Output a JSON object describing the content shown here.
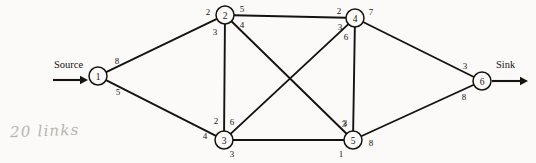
{
  "diagram": {
    "node_radius": 9,
    "ink_color": "#16130f",
    "background_color": "#fbfaf9",
    "pencil_color": "#b9b4ad",
    "terminals": {
      "source_label": "Source",
      "sink_label": "Sink"
    },
    "annotation": {
      "text": "20 links"
    },
    "nodes": [
      {
        "id": "1",
        "label": "1",
        "x": 98,
        "y": 76
      },
      {
        "id": "2",
        "label": "2",
        "x": 225,
        "y": 15
      },
      {
        "id": "3",
        "label": "3",
        "x": 224,
        "y": 140
      },
      {
        "id": "4",
        "label": "4",
        "x": 355,
        "y": 18
      },
      {
        "id": "5",
        "label": "5",
        "x": 353,
        "y": 140
      },
      {
        "id": "6",
        "label": "6",
        "x": 482,
        "y": 81
      }
    ],
    "edges": [
      {
        "id": "e-1-2",
        "from": "1",
        "to": "2",
        "cap_from": "8",
        "cap_to": "2",
        "from_label_x": 117,
        "from_label_y": 61,
        "to_label_x": 208,
        "to_label_y": 12
      },
      {
        "id": "e-1-3",
        "from": "1",
        "to": "3",
        "cap_from": "5",
        "cap_to": "4",
        "from_label_x": 118,
        "from_label_y": 92,
        "to_label_x": 205,
        "to_label_y": 136
      },
      {
        "id": "e-2-3",
        "from": "2",
        "to": "3",
        "cap_from": "3",
        "cap_to": "2",
        "from_label_x": 215,
        "from_label_y": 32,
        "to_label_x": 216,
        "to_label_y": 121
      },
      {
        "id": "e-2-4",
        "from": "2",
        "to": "4",
        "cap_from": "5",
        "cap_to": "2",
        "from_label_x": 242,
        "from_label_y": 9,
        "to_label_x": 339,
        "to_label_y": 11
      },
      {
        "id": "e-2-5",
        "from": "2",
        "to": "5",
        "cap_from": "4",
        "cap_to": "3",
        "from_label_x": 242,
        "from_label_y": 25,
        "to_label_x": 345,
        "to_label_y": 123
      },
      {
        "id": "e-3-4",
        "from": "3",
        "to": "4",
        "cap_from": "6",
        "cap_to": "3",
        "from_label_x": 232,
        "from_label_y": 122,
        "to_label_x": 340,
        "to_label_y": 27
      },
      {
        "id": "e-3-5",
        "from": "3",
        "to": "5",
        "cap_from": "3",
        "cap_to": "1",
        "from_label_x": 232,
        "from_label_y": 154,
        "to_label_x": 341,
        "to_label_y": 154
      },
      {
        "id": "e-4-5",
        "from": "4",
        "to": "5",
        "cap_from": "6",
        "cap_to": "3",
        "from_label_x": 346,
        "from_label_y": 37,
        "to_label_x": 344,
        "to_label_y": 124
      },
      {
        "id": "e-4-6",
        "from": "4",
        "to": "6",
        "cap_from": "7",
        "cap_to": "3",
        "from_label_x": 371,
        "from_label_y": 12,
        "to_label_x": 465,
        "to_label_y": 66
      },
      {
        "id": "e-5-6",
        "from": "5",
        "to": "6",
        "cap_from": "8",
        "cap_to": "8",
        "from_label_x": 371,
        "from_label_y": 143,
        "to_label_x": 464,
        "to_label_y": 97
      }
    ],
    "source_arrow": {
      "x1": 53,
      "y1": 80,
      "x2": 88,
      "y2": 80,
      "label_x": 54,
      "label_y": 68
    },
    "sink_arrow": {
      "x1": 492,
      "y1": 81,
      "x2": 528,
      "y2": 81,
      "label_x": 496,
      "label_y": 68
    }
  }
}
